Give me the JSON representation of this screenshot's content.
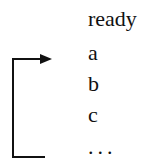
{
  "diagram": {
    "items": [
      "ready",
      "a",
      "b",
      "c",
      "..."
    ],
    "arrow": {
      "from": "...",
      "to": "a",
      "description": "loop-back arrow from last item to a"
    },
    "colors": {
      "line": "#111111",
      "text": "#111111"
    }
  }
}
